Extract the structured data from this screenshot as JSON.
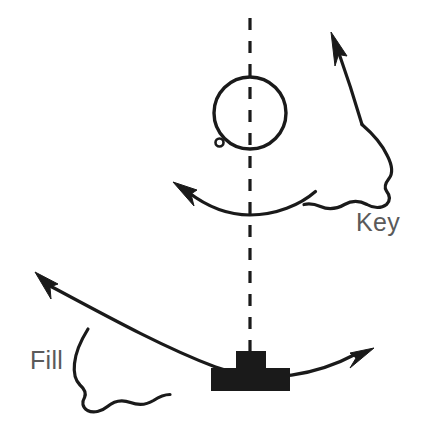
{
  "diagram": {
    "background_color": "#ffffff",
    "stroke_color": "#1a1a1a",
    "label_color": "#5a5a5a",
    "labels": [
      {
        "id": "key",
        "text": "Key",
        "x": 356,
        "y": 231
      },
      {
        "id": "fill",
        "text": "Fill",
        "x": 30,
        "y": 369
      }
    ],
    "axis": {
      "name": "vertical-dashed-axis",
      "x": 250,
      "y_start": 18,
      "y_end": 356,
      "dash": "12 11"
    },
    "circle": {
      "name": "open-circle-with-tail",
      "cx": 250,
      "cy": 113,
      "r": 36,
      "tail_loop_cx": 220,
      "tail_loop_cy": 143,
      "tail_loop_r": 4
    },
    "block": {
      "name": "solid-t-block",
      "stem_x": 238,
      "stem_y": 352,
      "stem_w": 28,
      "stem_h": 18,
      "bar_x": 212,
      "bar_y": 368,
      "bar_w": 78,
      "bar_h": 22
    },
    "curves": [
      {
        "id": "upper-curve",
        "d": "M 188 192 C 210 209 232 215 250 215 C 274 215 300 205 315 192",
        "arrow_at": "left",
        "arrow_tip": [
          173,
          182
        ],
        "arrow_angle": -138
      },
      {
        "id": "key-stem",
        "d": "M 336 48 C 345 72 354 98 362 124",
        "arrow_at": "top",
        "arrow_tip": [
          331,
          34
        ],
        "arrow_angle": -112
      },
      {
        "id": "lower-curve",
        "d": "M 47 284 C 110 318 165 348 215 367 C 268 386 318 374 358 354",
        "arrow_left_tip": [
          36,
          276
        ],
        "arrow_left_angle": -148,
        "arrow_right_tip": [
          372,
          349
        ],
        "arrow_right_angle": -28
      }
    ],
    "blobs": [
      {
        "id": "key-blob",
        "name": "key-region-blob",
        "d": "M 362 124 C 374 134 383 145 388 157 C 392 166 393 174 389 179 C 385 184 383 188 386 192 C 390 196 391 201 387 205 C 382 209 374 209 367 205 C 359 201 351 201 344 205 C 336 209 327 210 320 207 C 314 204 310 203 304 204 C 334 193 350 160 362 124 Z"
      },
      {
        "id": "fill-blob",
        "name": "fill-region-blob",
        "d": "M 88 329 C 80 341 75 353 74 364 C 73 373 75 381 80 385 C 85 389 87 393 85 398 C 82 403 83 408 88 411 C 94 414 102 412 108 407 C 115 401 123 400 131 403 C 139 406 148 405 154 401 C 160 397 164 395 170 395 C 140 385 112 360 88 329 Z"
      }
    ]
  }
}
